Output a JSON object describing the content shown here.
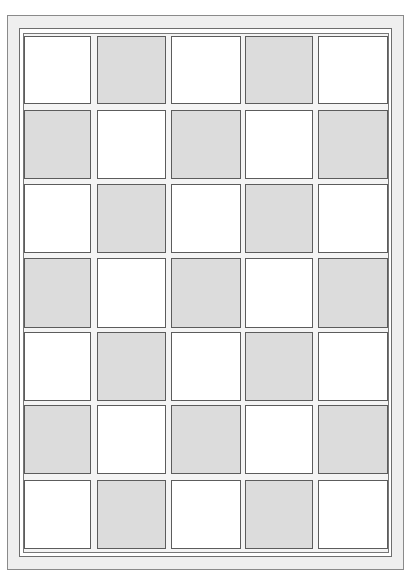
{
  "grid": {
    "rows": 7,
    "cols": 5,
    "colors": {
      "light": "#ffffff",
      "dark": "#dcdcdc",
      "frame": "#efefef",
      "line": "#5c5c5c"
    },
    "col_x": [
      24,
      97,
      171,
      245,
      318
    ],
    "col_w": [
      67,
      69,
      70,
      68,
      70
    ],
    "row_y": [
      36,
      110,
      184,
      258,
      332,
      405,
      480
    ],
    "row_h": [
      68,
      69,
      69,
      70,
      69,
      69,
      69
    ],
    "pattern": [
      [
        "light",
        "dark",
        "light",
        "dark",
        "light"
      ],
      [
        "dark",
        "light",
        "dark",
        "light",
        "dark"
      ],
      [
        "light",
        "dark",
        "light",
        "dark",
        "light"
      ],
      [
        "dark",
        "light",
        "dark",
        "light",
        "dark"
      ],
      [
        "light",
        "dark",
        "light",
        "dark",
        "light"
      ],
      [
        "dark",
        "light",
        "dark",
        "light",
        "dark"
      ],
      [
        "light",
        "dark",
        "light",
        "dark",
        "light"
      ]
    ]
  }
}
